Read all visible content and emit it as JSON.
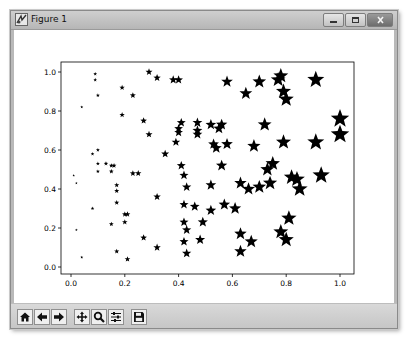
{
  "window": {
    "title": "Figure 1",
    "controls": [
      "minimize",
      "maximize",
      "close"
    ]
  },
  "toolbar": {
    "tools": [
      {
        "name": "home",
        "icon": "home-icon"
      },
      {
        "name": "back",
        "icon": "arrow-left-icon"
      },
      {
        "name": "forward",
        "icon": "arrow-right-icon"
      },
      {
        "name": "pan",
        "icon": "move-icon"
      },
      {
        "name": "zoom",
        "icon": "magnifier-icon"
      },
      {
        "name": "subplots",
        "icon": "sliders-icon"
      },
      {
        "name": "save",
        "icon": "floppy-disk-icon"
      }
    ]
  },
  "colors": {
    "marker": "#000000",
    "axes": "#000000",
    "titlebar": "#c4c4c4",
    "toolbar": "#d0d0d0"
  },
  "chart_data": {
    "type": "scatter",
    "title": "",
    "xlabel": "",
    "ylabel": "",
    "marker": "star",
    "marker_size_scales_with": "x",
    "xlim": [
      -0.05,
      1.05
    ],
    "ylim": [
      -0.02,
      1.03
    ],
    "grid": false,
    "legend": null,
    "xticks": [
      "0.0",
      "0.2",
      "0.4",
      "0.6",
      "0.8",
      "1.0"
    ],
    "yticks": [
      "0.0",
      "0.2",
      "0.4",
      "0.6",
      "0.8",
      "1.0"
    ],
    "points": [
      {
        "x": 0.01,
        "y": 0.47
      },
      {
        "x": 0.02,
        "y": 0.43
      },
      {
        "x": 0.02,
        "y": 0.19
      },
      {
        "x": 0.04,
        "y": 0.05
      },
      {
        "x": 0.04,
        "y": 0.82
      },
      {
        "x": 0.08,
        "y": 0.58
      },
      {
        "x": 0.09,
        "y": 0.99
      },
      {
        "x": 0.09,
        "y": 0.96
      },
      {
        "x": 0.1,
        "y": 0.88
      },
      {
        "x": 0.1,
        "y": 0.53
      },
      {
        "x": 0.1,
        "y": 0.49
      },
      {
        "x": 0.1,
        "y": 0.6
      },
      {
        "x": 0.08,
        "y": 0.3
      },
      {
        "x": 0.13,
        "y": 0.53
      },
      {
        "x": 0.15,
        "y": 0.52
      },
      {
        "x": 0.15,
        "y": 0.49
      },
      {
        "x": 0.16,
        "y": 0.52
      },
      {
        "x": 0.17,
        "y": 0.42
      },
      {
        "x": 0.17,
        "y": 0.39
      },
      {
        "x": 0.17,
        "y": 0.33
      },
      {
        "x": 0.17,
        "y": 0.08
      },
      {
        "x": 0.15,
        "y": 0.22
      },
      {
        "x": 0.2,
        "y": 0.27
      },
      {
        "x": 0.21,
        "y": 0.27
      },
      {
        "x": 0.2,
        "y": 0.23
      },
      {
        "x": 0.21,
        "y": 0.04
      },
      {
        "x": 0.19,
        "y": 0.92
      },
      {
        "x": 0.23,
        "y": 0.48
      },
      {
        "x": 0.25,
        "y": 0.48
      },
      {
        "x": 0.19,
        "y": 0.78
      },
      {
        "x": 0.23,
        "y": 0.88
      },
      {
        "x": 0.27,
        "y": 0.75
      },
      {
        "x": 0.27,
        "y": 0.15
      },
      {
        "x": 0.29,
        "y": 0.68
      },
      {
        "x": 0.29,
        "y": 1.0
      },
      {
        "x": 0.32,
        "y": 0.97
      },
      {
        "x": 0.32,
        "y": 0.36
      },
      {
        "x": 0.32,
        "y": 0.1
      },
      {
        "x": 0.35,
        "y": 0.58
      },
      {
        "x": 0.38,
        "y": 0.96
      },
      {
        "x": 0.4,
        "y": 0.96
      },
      {
        "x": 0.4,
        "y": 0.71
      },
      {
        "x": 0.41,
        "y": 0.74
      },
      {
        "x": 0.4,
        "y": 0.69
      },
      {
        "x": 0.39,
        "y": 0.64
      },
      {
        "x": 0.41,
        "y": 0.52
      },
      {
        "x": 0.42,
        "y": 0.47
      },
      {
        "x": 0.43,
        "y": 0.41
      },
      {
        "x": 0.42,
        "y": 0.32
      },
      {
        "x": 0.42,
        "y": 0.23
      },
      {
        "x": 0.43,
        "y": 0.19
      },
      {
        "x": 0.42,
        "y": 0.13
      },
      {
        "x": 0.43,
        "y": 0.07
      },
      {
        "x": 0.46,
        "y": 0.31
      },
      {
        "x": 0.47,
        "y": 0.74
      },
      {
        "x": 0.47,
        "y": 0.7
      },
      {
        "x": 0.47,
        "y": 0.68
      },
      {
        "x": 0.48,
        "y": 0.14
      },
      {
        "x": 0.49,
        "y": 0.23
      },
      {
        "x": 0.52,
        "y": 0.73
      },
      {
        "x": 0.53,
        "y": 0.63
      },
      {
        "x": 0.52,
        "y": 0.29
      },
      {
        "x": 0.52,
        "y": 0.42
      },
      {
        "x": 0.54,
        "y": 0.61
      },
      {
        "x": 0.55,
        "y": 0.71
      },
      {
        "x": 0.56,
        "y": 0.73
      },
      {
        "x": 0.57,
        "y": 0.32
      },
      {
        "x": 0.58,
        "y": 0.63
      },
      {
        "x": 0.58,
        "y": 0.95
      },
      {
        "x": 0.56,
        "y": 0.52
      },
      {
        "x": 0.61,
        "y": 0.3
      },
      {
        "x": 0.63,
        "y": 0.43
      },
      {
        "x": 0.63,
        "y": 0.17
      },
      {
        "x": 0.63,
        "y": 0.08
      },
      {
        "x": 0.65,
        "y": 0.89
      },
      {
        "x": 0.66,
        "y": 0.4
      },
      {
        "x": 0.68,
        "y": 0.62
      },
      {
        "x": 0.67,
        "y": 0.13
      },
      {
        "x": 0.7,
        "y": 0.95
      },
      {
        "x": 0.7,
        "y": 0.41
      },
      {
        "x": 0.72,
        "y": 0.73
      },
      {
        "x": 0.73,
        "y": 0.5
      },
      {
        "x": 0.74,
        "y": 0.43
      },
      {
        "x": 0.75,
        "y": 0.53
      },
      {
        "x": 0.77,
        "y": 0.96
      },
      {
        "x": 0.78,
        "y": 0.98
      },
      {
        "x": 0.79,
        "y": 0.9
      },
      {
        "x": 0.79,
        "y": 0.64
      },
      {
        "x": 0.78,
        "y": 0.18
      },
      {
        "x": 0.8,
        "y": 0.14
      },
      {
        "x": 0.8,
        "y": 0.86
      },
      {
        "x": 0.81,
        "y": 0.25
      },
      {
        "x": 0.82,
        "y": 0.46
      },
      {
        "x": 0.84,
        "y": 0.45
      },
      {
        "x": 0.85,
        "y": 0.4
      },
      {
        "x": 0.91,
        "y": 0.96
      },
      {
        "x": 0.91,
        "y": 0.64
      },
      {
        "x": 0.93,
        "y": 0.47
      },
      {
        "x": 1.0,
        "y": 0.76
      },
      {
        "x": 1.0,
        "y": 0.68
      }
    ]
  }
}
